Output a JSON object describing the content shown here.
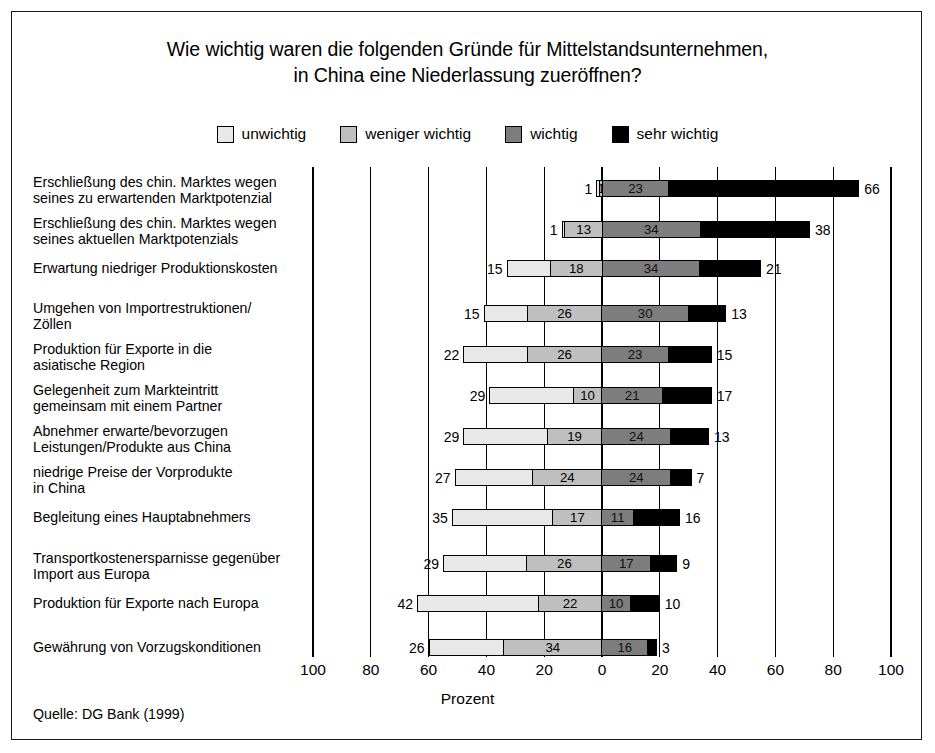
{
  "title": "Wie wichtig waren die folgenden Gründe für Mittelstandsunternehmen,\nin China eine Niederlassung zueröffnen?",
  "title_line1": "Wie wichtig waren die folgenden Gründe für Mittelstandsunternehmen,",
  "title_line2": "in China eine Niederlassung zueröffnen?",
  "source": "Quelle: DG Bank (1999)",
  "axis_name": "Prozent",
  "colors": {
    "unwichtig": "#e8e8e8",
    "weniger_wichtig": "#bfbfbf",
    "wichtig": "#7d7d7d",
    "sehr_wichtig": "#000000",
    "frame": "#1a1a1a",
    "background": "#ffffff"
  },
  "legend": {
    "items": [
      {
        "label": "unwichtig",
        "swatch": "#e8e8e8"
      },
      {
        "label": "weniger wichtig",
        "swatch": "#bfbfbf"
      },
      {
        "label": "wichtig",
        "swatch": "#7d7d7d"
      },
      {
        "label": "sehr wichtig",
        "swatch": "#000000"
      }
    ]
  },
  "chart_data": {
    "type": "bar",
    "subtype": "diverging-stacked-horizontal",
    "title": "Wie wichtig waren die folgenden Gründe für Mittelstandsunternehmen, in China eine Niederlassung zueröffnen?",
    "xlabel": "Prozent",
    "ylabel": "",
    "xlim": [
      -100,
      100
    ],
    "xticks": [
      100,
      80,
      60,
      40,
      20,
      0,
      20,
      40,
      60,
      80,
      100
    ],
    "xtick_labels": [
      "100",
      "80",
      "60",
      "40",
      "20",
      "0",
      "20",
      "40",
      "60",
      "80",
      "100"
    ],
    "grid": true,
    "legend_position": "top",
    "series": [
      {
        "name": "unwichtig",
        "color": "#e8e8e8",
        "values": [
          1,
          1,
          15,
          15,
          22,
          29,
          29,
          27,
          35,
          29,
          42,
          26
        ]
      },
      {
        "name": "weniger wichtig",
        "color": "#bfbfbf",
        "values": [
          1,
          13,
          18,
          26,
          26,
          10,
          19,
          24,
          17,
          26,
          22,
          34
        ]
      },
      {
        "name": "wichtig",
        "color": "#7d7d7d",
        "values": [
          23,
          34,
          34,
          30,
          23,
          21,
          24,
          24,
          11,
          17,
          10,
          16
        ]
      },
      {
        "name": "sehr wichtig",
        "color": "#000000",
        "values": [
          66,
          38,
          21,
          13,
          15,
          17,
          13,
          7,
          16,
          9,
          10,
          3
        ]
      }
    ],
    "categories": [
      "Erschließung des chin. Marktes wegen seines zu erwartenden Marktpotenzial",
      "Erschließung des chin. Marktes wegen seines aktuellen Marktpotenzials",
      "Erwartung niedriger Produktionskosten",
      "Umgehen von Importrestruktionen/ Zöllen",
      "Produktion für Exporte in die asiatische Region",
      "Gelegenheit zum Markteintritt gemeinsam mit einem Partner",
      "Abnehmer erwarte/bevorzugen Leistungen/Produkte aus China",
      "niedrige Preise der Vorprodukte in China",
      "Begleitung eines Hauptabnehmers",
      "Transportkostenersparnisse gegenüber Import aus Europa",
      "Produktion für Exporte nach Europa",
      "Gewährung von Vorzugskonditionen"
    ]
  },
  "rows": [
    {
      "label_lines": [
        "Erschließung des chin. Marktes wegen",
        "seines zu erwartenden Marktpotenzial"
      ],
      "values": [
        1,
        1,
        23,
        66
      ],
      "gap_before": false
    },
    {
      "label_lines": [
        "Erschließung des chin. Marktes wegen",
        "seines aktuellen Marktpotenzials"
      ],
      "values": [
        1,
        13,
        34,
        38
      ],
      "gap_before": false
    },
    {
      "label_lines": [
        "Erwartung niedriger Produktionskosten"
      ],
      "values": [
        15,
        18,
        34,
        21
      ],
      "gap_before": false
    },
    {
      "label_lines": [
        "Umgehen von Importrestruktionen/",
        "Zöllen"
      ],
      "values": [
        15,
        26,
        30,
        13
      ],
      "gap_before": true
    },
    {
      "label_lines": [
        "Produktion für Exporte in die",
        "asiatische Region"
      ],
      "values": [
        22,
        26,
        23,
        15
      ],
      "gap_before": false
    },
    {
      "label_lines": [
        "Gelegenheit zum Markteintritt",
        "gemeinsam mit einem Partner"
      ],
      "values": [
        29,
        10,
        21,
        17
      ],
      "gap_before": false
    },
    {
      "label_lines": [
        "Abnehmer erwarte/bevorzugen",
        "Leistungen/Produkte aus China"
      ],
      "values": [
        29,
        19,
        24,
        13
      ],
      "gap_before": false
    },
    {
      "label_lines": [
        "niedrige Preise der Vorprodukte",
        "in China"
      ],
      "values": [
        27,
        24,
        24,
        7
      ],
      "gap_before": false
    },
    {
      "label_lines": [
        "Begleitung eines Hauptabnehmers"
      ],
      "values": [
        35,
        17,
        11,
        16
      ],
      "gap_before": false
    },
    {
      "label_lines": [
        "Transportkostenersparnisse gegenüber",
        "Import aus Europa"
      ],
      "values": [
        29,
        26,
        17,
        9
      ],
      "gap_before": true
    },
    {
      "label_lines": [
        "Produktion für Exporte nach Europa"
      ],
      "values": [
        42,
        22,
        10,
        10
      ],
      "gap_before": false
    },
    {
      "label_lines": [
        "Gewährung von Vorzugskonditionen"
      ],
      "values": [
        26,
        34,
        16,
        3
      ],
      "gap_before": true
    }
  ]
}
